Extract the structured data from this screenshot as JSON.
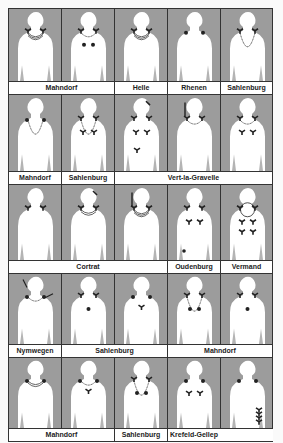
{
  "figure": {
    "colors": {
      "background": "#9c9c9c",
      "figure": "#ffffff",
      "shade": "#b4b4b4",
      "ink": "#222222",
      "border": "#333333"
    },
    "rows": [
      {
        "height": 72,
        "panels": [
          {
            "ornament": "multi-strand-necklace",
            "fibulae": "shoulder-pair"
          },
          {
            "ornament": "single-strand-necklace",
            "fibulae": "shoulder-pair",
            "extra": "two-chest-dots"
          },
          {
            "ornament": "multi-strand-necklace",
            "fibulae": "shoulder-pair"
          },
          {
            "ornament": "none",
            "fibulae": "shoulder-dots"
          },
          {
            "ornament": "long-necklace-pendant",
            "fibulae": "shoulder-pair"
          }
        ],
        "labels": [
          {
            "text": "Mahndorf",
            "span": 2
          },
          {
            "text": "Helle",
            "span": 1
          },
          {
            "text": "Rhenen",
            "span": 1
          },
          {
            "text": "Sahlenburg",
            "span": 1
          }
        ]
      },
      {
        "height": 76,
        "panels": [
          {
            "ornament": "long-bead-necklace",
            "fibulae": "shoulder-dots"
          },
          {
            "ornament": "long-necklace",
            "fibulae": "four-brooches"
          },
          {
            "ornament": "none",
            "fibulae": "scattered-brooches",
            "extra": "hairpin"
          },
          {
            "ornament": "collar-necklace",
            "fibulae": "shoulder-pair",
            "extra": "pin-and-brooch"
          },
          {
            "ornament": "collar-necklace",
            "fibulae": "shoulder-pair",
            "extra": "two-chest-brooches"
          }
        ],
        "labels": [
          {
            "text": "Mahndorf",
            "span": 1
          },
          {
            "text": "Sahlenburg",
            "span": 1
          },
          {
            "text": "Vert-la-Gravelle",
            "span": 3
          }
        ]
      },
      {
        "height": 75,
        "panels": [
          {
            "ornament": "none",
            "fibulae": "shoulder-pair"
          },
          {
            "ornament": "double-collar",
            "fibulae": "shoulder-pair",
            "extra": "hairpin"
          },
          {
            "ornament": "triple-necklace",
            "fibulae": "shoulder-pair",
            "extra": "long-pin"
          },
          {
            "ornament": "none",
            "fibulae": "four-brooches",
            "extra": "belt-dot"
          },
          {
            "ornament": "round-neck-ring",
            "fibulae": "six-brooches"
          }
        ],
        "labels": [
          {
            "text": "Cortrat",
            "span": 3
          },
          {
            "text": "Oudenburg",
            "span": 1
          },
          {
            "text": "Vermand",
            "span": 1
          }
        ]
      },
      {
        "height": 70,
        "panels": [
          {
            "ornament": "single-strand-necklace",
            "fibulae": "shoulder-dots",
            "extra": "two-pins-and-chest-brooch"
          },
          {
            "ornament": "none",
            "fibulae": "shoulder-dot-and-brooch",
            "extra": "chest-dot"
          },
          {
            "ornament": "none",
            "fibulae": "shoulder-dots",
            "extra": "chest-brooch"
          },
          {
            "ornament": "long-bead-necklace",
            "fibulae": "shoulder-pair",
            "extra": "two-chest-dots"
          },
          {
            "ornament": "none",
            "fibulae": "shoulder-pair",
            "extra": "chest-dot"
          }
        ],
        "labels": [
          {
            "text": "Nymwegen",
            "span": 1
          },
          {
            "text": "Sahlenburg",
            "span": 2
          },
          {
            "text": "Mahndorf",
            "span": 2
          }
        ]
      },
      {
        "height": 70,
        "panels": [
          {
            "ornament": "double-necklace",
            "fibulae": "shoulder-dots"
          },
          {
            "ornament": "single-strand-necklace",
            "fibulae": "shoulder-dots",
            "extra": "chest-brooch"
          },
          {
            "ornament": "long-necklace",
            "fibulae": "one-brooch",
            "extra": "two-chest-dots"
          },
          {
            "ornament": "none",
            "fibulae": "shoulder-dots",
            "extra": "two-chest-brooches"
          },
          {
            "ornament": "none",
            "fibulae": "shoulder-dots",
            "extra": "side-brooch-row"
          }
        ],
        "labels": [
          {
            "text": "Mahndorf",
            "span": 2
          },
          {
            "text": "Sahlenburg",
            "span": 1
          },
          {
            "text": "Krefeld-Gellep",
            "span": 1
          },
          {
            "text": "",
            "span": 1
          }
        ]
      }
    ]
  }
}
